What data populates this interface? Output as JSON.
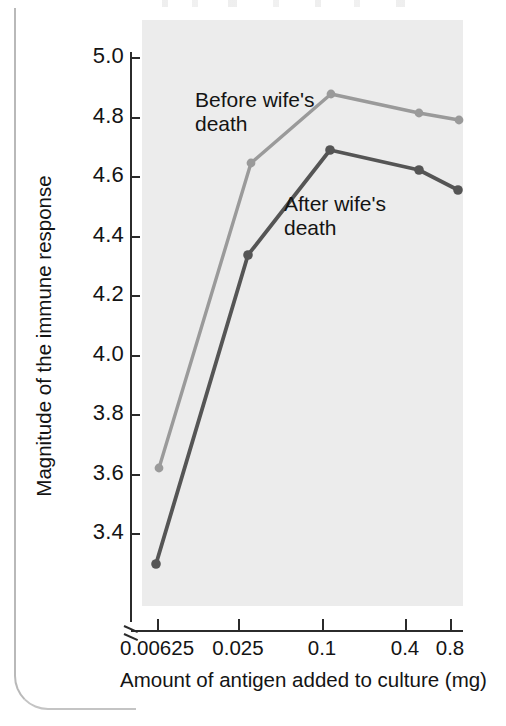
{
  "figure": {
    "colors": {
      "plot_background": "#ececec",
      "axis": "#2b2b2b",
      "before_series": "#9a9a9a",
      "after_series": "#555555",
      "page_edge": "#b9b9b9"
    },
    "ylabel": "Magnitude of the immune response",
    "xlabel": "Amount of antigen added to culture (mg)",
    "annotations": {
      "before": "Before wife's\ndeath",
      "after": "After wife's\ndeath"
    }
  },
  "chart_data": {
    "type": "line",
    "title": "",
    "xlabel": "Amount of antigen added to culture (mg)",
    "ylabel": "Magnitude of the immune response",
    "x_scale": "log",
    "categories": [
      "0.00625",
      "0.025",
      "0.1",
      "0.4",
      "0.8"
    ],
    "x": [
      0.00625,
      0.025,
      0.1,
      0.4,
      0.8
    ],
    "xtick_labels": [
      "0.00625",
      "0.025",
      "0.1",
      "0.4",
      "0.8"
    ],
    "ytick_labels": [
      "3.4",
      "3.6",
      "3.8",
      "4.0",
      "4.2",
      "4.4",
      "4.6",
      "4.8",
      "5.0"
    ],
    "yticks": [
      3.4,
      3.6,
      3.8,
      4.0,
      4.2,
      4.4,
      4.6,
      4.8,
      5.0
    ],
    "ylim": [
      3.4,
      5.0
    ],
    "y_axis_break": true,
    "grid": false,
    "legend": "inline-annotations",
    "series": [
      {
        "name": "Before wife's death",
        "color": "#9a9a9a",
        "values": [
          3.78,
          4.68,
          4.89,
          4.82,
          4.81
        ]
      },
      {
        "name": "After wife's death",
        "color": "#555555",
        "values": [
          3.49,
          4.42,
          4.74,
          4.66,
          4.6
        ]
      }
    ]
  },
  "yticks_px": [
    {
      "label": "5.0",
      "y": 57
    },
    {
      "label": "4.8",
      "y": 117
    },
    {
      "label": "4.6",
      "y": 176
    },
    {
      "label": "4.4",
      "y": 236
    },
    {
      "label": "4.2",
      "y": 295
    },
    {
      "label": "4.0",
      "y": 355
    },
    {
      "label": "3.8",
      "y": 414
    },
    {
      "label": "3.6",
      "y": 474
    },
    {
      "label": "3.4",
      "y": 533
    }
  ],
  "xticks_px": [
    {
      "label": "0.00625",
      "x": 157
    },
    {
      "label": "0.025",
      "x": 238
    },
    {
      "label": "0.1",
      "x": 322
    },
    {
      "label": "0.4",
      "x": 405
    },
    {
      "label": "0.8",
      "x": 450
    }
  ],
  "points_px": {
    "before": [
      {
        "x": 159,
        "y": 468
      },
      {
        "x": 251,
        "y": 163
      },
      {
        "x": 331,
        "y": 94
      },
      {
        "x": 419,
        "y": 113
      },
      {
        "x": 459,
        "y": 120
      }
    ],
    "after": [
      {
        "x": 156,
        "y": 564
      },
      {
        "x": 248,
        "y": 255
      },
      {
        "x": 330,
        "y": 150
      },
      {
        "x": 419,
        "y": 170
      },
      {
        "x": 458,
        "y": 190
      }
    ]
  }
}
